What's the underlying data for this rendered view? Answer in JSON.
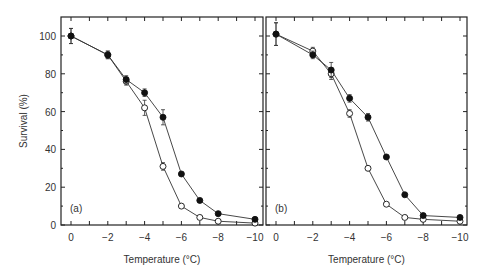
{
  "chart_data": [
    {
      "type": "line",
      "panel_label": "(a)",
      "xlabel": "Temperature (°C)",
      "ylabel": "Survival (%)",
      "x": [
        0,
        -2,
        -3,
        -4,
        -5,
        -6,
        -7,
        -8,
        -10
      ],
      "xticks": [
        0,
        -2,
        -4,
        -6,
        -8,
        -10
      ],
      "yticks": [
        0,
        20,
        40,
        60,
        80,
        100
      ],
      "xlim": [
        0.5,
        -10.5
      ],
      "ylim": [
        0,
        110
      ],
      "grid": false,
      "series": [
        {
          "name": "filled",
          "marker": "filled-circle",
          "values": [
            100,
            90,
            77,
            70,
            57,
            27,
            13,
            6,
            3
          ],
          "err": [
            4,
            2,
            2,
            2,
            4,
            1,
            1,
            1,
            1
          ]
        },
        {
          "name": "open",
          "marker": "open-circle",
          "values": [
            100,
            90,
            76,
            62,
            31,
            10,
            4,
            2,
            1
          ],
          "err": [
            4,
            2,
            2,
            4,
            2,
            1,
            1,
            1,
            1
          ]
        }
      ]
    },
    {
      "type": "line",
      "panel_label": "(b)",
      "xlabel": "Temperature (°C)",
      "ylabel": "Survival (%)",
      "x": [
        0,
        -2,
        -3,
        -4,
        -5,
        -6,
        -7,
        -8,
        -10
      ],
      "xticks": [
        0,
        -2,
        -4,
        -6,
        -8,
        -10
      ],
      "yticks": [
        0,
        20,
        40,
        60,
        80,
        100
      ],
      "xlim": [
        0.5,
        -10.5
      ],
      "ylim": [
        0,
        110
      ],
      "grid": false,
      "series": [
        {
          "name": "filled",
          "marker": "filled-circle",
          "values": [
            101,
            90,
            82,
            67,
            57,
            36,
            16,
            5,
            4
          ],
          "err": [
            6,
            2,
            4,
            2,
            2,
            1,
            1,
            1,
            1
          ]
        },
        {
          "name": "open",
          "marker": "open-circle",
          "values": [
            101,
            92,
            80,
            59,
            30,
            11,
            4,
            3,
            2
          ],
          "err": [
            6,
            2,
            3,
            2,
            1,
            1,
            1,
            1,
            1
          ]
        }
      ]
    }
  ]
}
